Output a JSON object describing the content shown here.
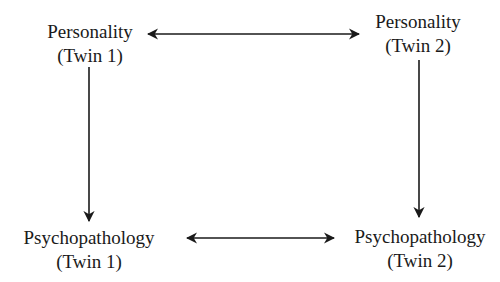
{
  "diagram": {
    "type": "path-diagram",
    "nodes": [
      {
        "id": "personality_twin1",
        "line1": "Personality",
        "line2": "(Twin 1)"
      },
      {
        "id": "personality_twin2",
        "line1": "Personality",
        "line2": "(Twin 2)"
      },
      {
        "id": "psychopathology_twin1",
        "line1": "Psychopathology",
        "line2": "(Twin 1)"
      },
      {
        "id": "psychopathology_twin2",
        "line1": "Psychopathology",
        "line2": "(Twin 2)"
      }
    ],
    "edges": [
      {
        "from": "personality_twin1",
        "to": "personality_twin2",
        "style": "bidirectional"
      },
      {
        "from": "psychopathology_twin1",
        "to": "psychopathology_twin2",
        "style": "bidirectional"
      },
      {
        "from": "personality_twin1",
        "to": "psychopathology_twin1",
        "style": "directed"
      },
      {
        "from": "personality_twin2",
        "to": "psychopathology_twin2",
        "style": "directed"
      }
    ],
    "colors": {
      "ink": "#1a1a1a",
      "background": "#ffffff"
    }
  }
}
